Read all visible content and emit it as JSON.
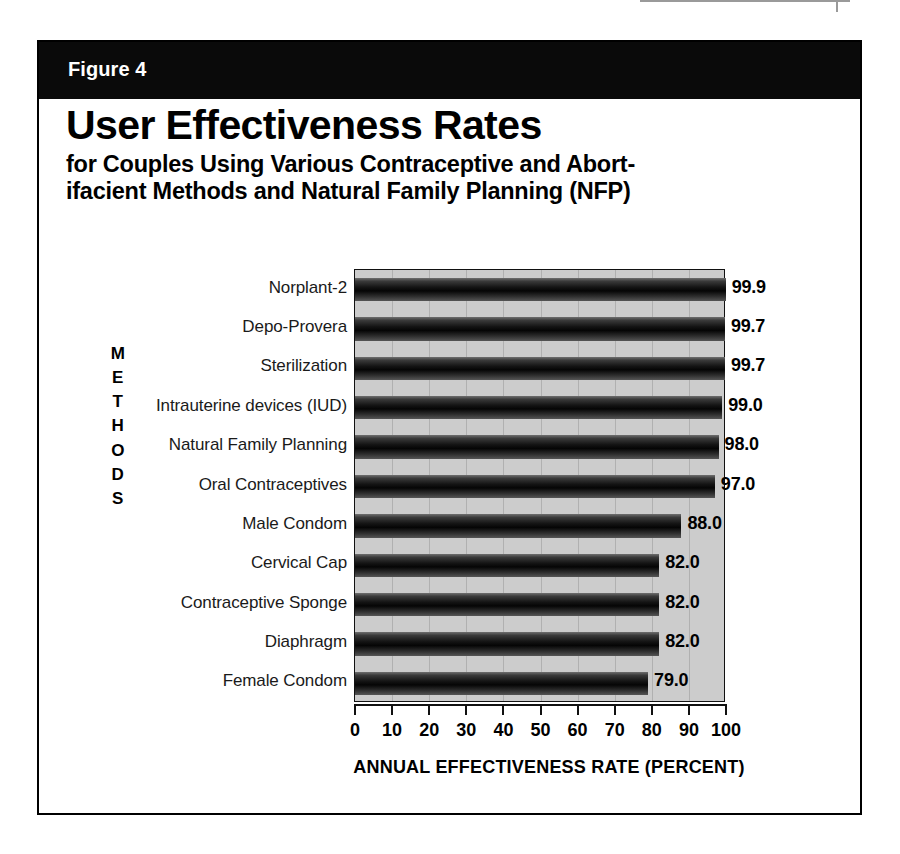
{
  "figure": {
    "band_label": "Figure 4",
    "title": "User Effectiveness Rates",
    "subtitle_line1": "for Couples Using Various Contraceptive and Abort-",
    "subtitle_line2": "ifacient Methods and Natural Family Planning (NFP)"
  },
  "axes": {
    "y_title_letters": [
      "M",
      "E",
      "T",
      "H",
      "O",
      "D",
      "S"
    ],
    "y_title": "METHODS",
    "x_title": "ANNUAL EFFECTIVENESS RATE (PERCENT)",
    "x_ticks": [
      "0",
      "10",
      "20",
      "30",
      "40",
      "50",
      "60",
      "70",
      "80",
      "90",
      "100"
    ]
  },
  "colors": {
    "band": "#0a0a0a",
    "plot_background": "#cccccc",
    "bar_dark": "#0b0b0b",
    "bar_highlight": "#6f6f6f",
    "gridline": "#b0b0b0",
    "text": "#000000",
    "frame": "#000000"
  },
  "chart_data": {
    "type": "bar",
    "orientation": "horizontal",
    "title": "User Effectiveness Rates",
    "subtitle": "for Couples Using Various Contraceptive and Abortifacient Methods and Natural Family Planning (NFP)",
    "xlabel": "ANNUAL EFFECTIVENESS RATE (PERCENT)",
    "ylabel": "METHODS",
    "xlim": [
      0,
      100
    ],
    "xticks": [
      0,
      10,
      20,
      30,
      40,
      50,
      60,
      70,
      80,
      90,
      100
    ],
    "grid": true,
    "legend": false,
    "categories": [
      "Norplant-2",
      "Depo-Provera",
      "Sterilization",
      "Intrauterine devices (IUD)",
      "Natural Family Planning",
      "Oral Contraceptives",
      "Male Condom",
      "Cervical Cap",
      "Contraceptive Sponge",
      "Diaphragm",
      "Female Condom"
    ],
    "values": [
      99.9,
      99.7,
      99.7,
      99.0,
      98.0,
      97.0,
      88.0,
      82.0,
      82.0,
      82.0,
      79.0
    ],
    "value_labels": [
      "99.9",
      "99.7",
      "99.7",
      "99.0",
      "98.0",
      "97.0",
      "88.0",
      "82.0",
      "82.0",
      "82.0",
      "79.0"
    ]
  }
}
